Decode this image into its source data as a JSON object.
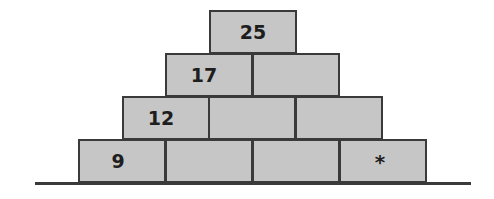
{
  "diagram": {
    "type": "number-pyramid",
    "rows": [
      {
        "level": 1,
        "cells": [
          "25"
        ]
      },
      {
        "level": 2,
        "cells": [
          "17",
          ""
        ]
      },
      {
        "level": 3,
        "cells": [
          "12",
          "",
          ""
        ]
      },
      {
        "level": 4,
        "cells": [
          "9",
          "",
          "",
          "*"
        ]
      }
    ],
    "colors": {
      "block_fill": "#c6c6c6",
      "block_border": "#3a3a3a",
      "text": "#1e1e1e",
      "background": "#ffffff"
    }
  }
}
